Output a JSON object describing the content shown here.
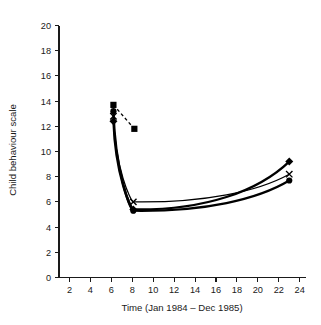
{
  "chart_data": {
    "type": "line",
    "title": "",
    "xlabel": "Time (Jan 1984 – Dec 1985)",
    "ylabel": "Child behaviour scale",
    "xlim": [
      1,
      24.6
    ],
    "ylim": [
      0,
      20
    ],
    "xticks": [
      2,
      4,
      6,
      8,
      10,
      12,
      14,
      16,
      18,
      20,
      22,
      24
    ],
    "yticks": [
      0,
      2,
      4,
      6,
      8,
      10,
      12,
      14,
      16,
      18,
      20
    ],
    "xtick_labels": [
      "2",
      "4",
      "6",
      "8",
      "10",
      "12",
      "14",
      "16",
      "18",
      "20",
      "22",
      "24"
    ],
    "ytick_labels": [
      "0",
      "2",
      "4",
      "6",
      "8",
      "10",
      "12",
      "14",
      "16",
      "18",
      "20"
    ],
    "grid": false,
    "legend": "none",
    "series": [
      {
        "name": "square-series",
        "marker": "square",
        "linestyle": "dashed",
        "x": [
          6.2,
          8.2
        ],
        "values": [
          13.7,
          11.8
        ]
      },
      {
        "name": "circle-series",
        "marker": "circle",
        "linestyle": "solid",
        "x": [
          6.2,
          8.1,
          23.0
        ],
        "values": [
          13.2,
          5.3,
          7.7
        ]
      },
      {
        "name": "diamond-series",
        "marker": "diamond",
        "linestyle": "solid",
        "x": [
          6.2,
          8.1,
          23.0
        ],
        "values": [
          12.4,
          5.4,
          9.2
        ]
      },
      {
        "name": "cross-series",
        "marker": "x",
        "linestyle": "solid",
        "x": [
          6.2,
          8.1,
          23.0
        ],
        "values": [
          12.8,
          6.0,
          8.2
        ]
      }
    ]
  }
}
